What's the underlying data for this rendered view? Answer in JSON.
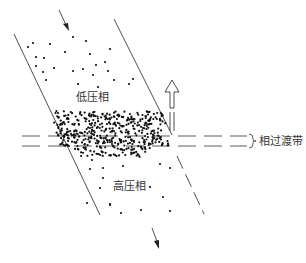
{
  "diagram": {
    "type": "phase-transition-band schematic",
    "labels": {
      "low_pressure_phase": "低压相",
      "high_pressure_phase": "高压相",
      "transition_band": "相过渡带"
    },
    "arrows": {
      "inflow": "downward arrow entering channel at top",
      "outflow": "downward arrow leaving channel at bottom",
      "band_motion": "hollow upward arrow (transition band moves upward)"
    },
    "regions": [
      {
        "name": "low-pressure-region",
        "density": "sparse"
      },
      {
        "name": "transition-band",
        "density": "dense"
      },
      {
        "name": "high-pressure-region",
        "density": "sparse"
      }
    ],
    "colors": {
      "line": "#222222",
      "dot": "#111111",
      "text": "#333333",
      "background": "#ffffff"
    }
  }
}
